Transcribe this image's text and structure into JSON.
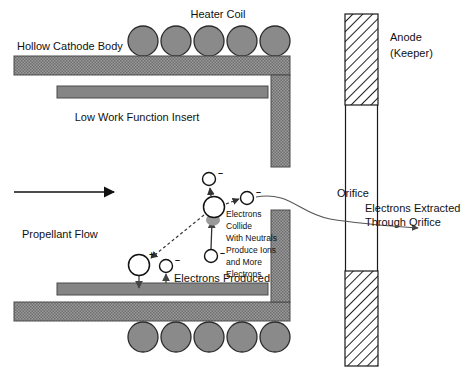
{
  "figure": {
    "background_color": "#ffffff",
    "line_color": "#111111",
    "metal_fill": "#8c8c8c",
    "insert_fill": "#858585",
    "coil_fill": "#8a8a8a",
    "anode_fill": "#ffffff",
    "anode_hatch_color": "#222222"
  },
  "labels": {
    "heater_coil": "Heater Coil",
    "hollow_cathode_body": "Hollow Cathode Body",
    "low_work_function_insert": "Low Work Function Insert",
    "propellant_flow": "Propellant Flow",
    "electrons_produced": "Electrons Produced",
    "orifice": "Orifice",
    "anode_line1": "Anode",
    "anode_line2": "(Keeper)",
    "extracted_line1": "Electrons Extracted",
    "extracted_line2": "Through Orifice"
  },
  "collision_note": {
    "lines": [
      "Electrons",
      "Collide",
      "With Neutrals",
      "Produce Ions",
      "and More",
      "Electrons"
    ]
  },
  "particles": {
    "ion_symbol": "+",
    "electron_symbol": "–",
    "items": [
      {
        "name": "central-ion",
        "type": "ion",
        "cx": 214,
        "cy": 207,
        "r": 10.5,
        "charge": ""
      },
      {
        "name": "electron-upper",
        "type": "electron",
        "cx": 209,
        "cy": 179,
        "r": 6.5,
        "charge": "–"
      },
      {
        "name": "electron-right",
        "type": "electron",
        "cx": 247,
        "cy": 198,
        "r": 6.5,
        "charge": "–"
      },
      {
        "name": "electron-lower-center",
        "type": "electron",
        "cx": 211,
        "cy": 256,
        "r": 6.5,
        "charge": "–"
      },
      {
        "name": "ion-lower-left",
        "type": "ion",
        "cx": 139,
        "cy": 265,
        "r": 10.5,
        "charge": "+"
      },
      {
        "name": "electron-lower-left",
        "type": "electron",
        "cx": 166,
        "cy": 266,
        "r": 6.5,
        "charge": "–"
      }
    ]
  },
  "heater_coils": {
    "top_row": {
      "count": 5,
      "cy": 41,
      "r": 15,
      "start_cx": 143,
      "spacing": 33
    },
    "bottom_row": {
      "count": 5,
      "cy": 337,
      "r": 15,
      "start_cx": 143,
      "spacing": 33
    }
  },
  "anode": {
    "x": 345,
    "width": 33,
    "upper_segment": {
      "y": 14,
      "height": 91
    },
    "lower_segment": {
      "y": 271,
      "height": 95
    },
    "gap": {
      "y": 105,
      "height": 166
    }
  }
}
